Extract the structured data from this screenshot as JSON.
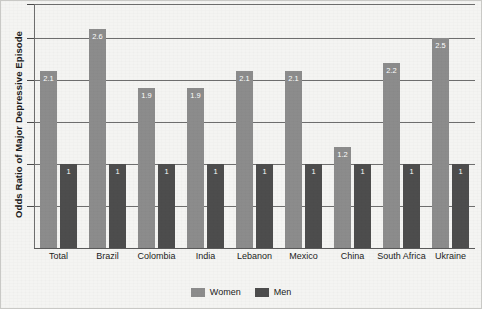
{
  "chart_data": {
    "type": "bar",
    "title": "",
    "subtitle": "",
    "xlabel": "",
    "ylabel": "Odds Ratio of Major Depressive Episode",
    "categories": [
      "Total",
      "Brazil",
      "Colombia",
      "India",
      "Lebanon",
      "Mexico",
      "China",
      "South Africa",
      "Ukraine"
    ],
    "series": [
      {
        "name": "Women",
        "color": "#8c8c8c",
        "values": [
          2.1,
          2.6,
          1.9,
          1.9,
          2.1,
          2.1,
          1.2,
          2.2,
          2.5
        ],
        "labels": [
          "2.1",
          "2.6",
          "1.9",
          "1.9",
          "2.1",
          "2.1",
          "1.2",
          "2.2",
          "2.5"
        ]
      },
      {
        "name": "Men",
        "color": "#4d4d4d",
        "values": [
          1,
          1,
          1,
          1,
          1,
          1,
          1,
          1,
          1
        ],
        "labels": [
          "1",
          "1",
          "1",
          "1",
          "1",
          "1",
          "1",
          "1",
          "1"
        ]
      }
    ],
    "ylim": [
      0,
      2.9
    ],
    "yticks": [
      0.5,
      1.0,
      1.5,
      2.0,
      2.5,
      2.9
    ],
    "ytick_labels": [],
    "grid": true,
    "legend_position": "bottom-center"
  },
  "legend": {
    "items": [
      {
        "label": "Women",
        "color": "#8c8c8c"
      },
      {
        "label": "Men",
        "color": "#4d4d4d"
      }
    ]
  },
  "axis": {
    "y_title": "Odds Ratio of Major Depressive Episode"
  }
}
